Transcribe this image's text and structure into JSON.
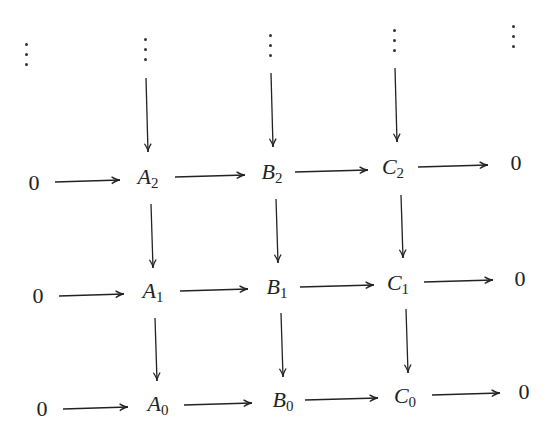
{
  "diagram": {
    "type": "commutative-diagram",
    "rows": [
      {
        "index": 2,
        "nodes": [
          {
            "id": "z2l",
            "label": "0",
            "sub": "",
            "x": 34,
            "y": 183
          },
          {
            "id": "A2",
            "label": "A",
            "sub": "2",
            "x": 148,
            "y": 178
          },
          {
            "id": "B2",
            "label": "B",
            "sub": "2",
            "x": 272,
            "y": 173
          },
          {
            "id": "C2",
            "label": "C",
            "sub": "2",
            "x": 393,
            "y": 168
          },
          {
            "id": "z2r",
            "label": "0",
            "sub": "",
            "x": 516,
            "y": 163
          }
        ]
      },
      {
        "index": 1,
        "nodes": [
          {
            "id": "z1l",
            "label": "0",
            "sub": "",
            "x": 38,
            "y": 296
          },
          {
            "id": "A1",
            "label": "A",
            "sub": "1",
            "x": 153,
            "y": 292
          },
          {
            "id": "B1",
            "label": "B",
            "sub": "1",
            "x": 277,
            "y": 288
          },
          {
            "id": "C1",
            "label": "C",
            "sub": "1",
            "x": 398,
            "y": 284
          },
          {
            "id": "z1r",
            "label": "0",
            "sub": "",
            "x": 520,
            "y": 279
          }
        ]
      },
      {
        "index": 0,
        "nodes": [
          {
            "id": "z0l",
            "label": "0",
            "sub": "",
            "x": 42,
            "y": 409
          },
          {
            "id": "A0",
            "label": "A",
            "sub": "0",
            "x": 158,
            "y": 405
          },
          {
            "id": "B0",
            "label": "B",
            "sub": "0",
            "x": 283,
            "y": 401
          },
          {
            "id": "C0",
            "label": "C",
            "sub": "0",
            "x": 405,
            "y": 397
          },
          {
            "id": "z0r",
            "label": "0",
            "sub": "",
            "x": 524,
            "y": 392
          }
        ]
      }
    ],
    "vdots": [
      {
        "x": 27,
        "y": 55
      },
      {
        "x": 146,
        "y": 50
      },
      {
        "x": 271,
        "y": 46
      },
      {
        "x": 395,
        "y": 41
      },
      {
        "x": 514,
        "y": 37
      }
    ],
    "arrows": {
      "horizontal": [
        {
          "from": "0",
          "to": "A2",
          "x1": 55,
          "y1": 182,
          "x2": 120,
          "y2": 180
        },
        {
          "from": "A2",
          "to": "B2",
          "x1": 175,
          "y1": 177,
          "x2": 245,
          "y2": 175
        },
        {
          "from": "B2",
          "to": "C2",
          "x1": 295,
          "y1": 172,
          "x2": 368,
          "y2": 170
        },
        {
          "from": "C2",
          "to": "0",
          "x1": 418,
          "y1": 167,
          "x2": 488,
          "y2": 165
        },
        {
          "from": "0",
          "to": "A1",
          "x1": 59,
          "y1": 296,
          "x2": 124,
          "y2": 294
        },
        {
          "from": "A1",
          "to": "B1",
          "x1": 180,
          "y1": 291,
          "x2": 248,
          "y2": 289
        },
        {
          "from": "B1",
          "to": "C1",
          "x1": 300,
          "y1": 287,
          "x2": 374,
          "y2": 285
        },
        {
          "from": "C1",
          "to": "0",
          "x1": 424,
          "y1": 282,
          "x2": 493,
          "y2": 280
        },
        {
          "from": "0",
          "to": "A0",
          "x1": 63,
          "y1": 409,
          "x2": 128,
          "y2": 407
        },
        {
          "from": "A0",
          "to": "B0",
          "x1": 184,
          "y1": 405,
          "x2": 252,
          "y2": 403
        },
        {
          "from": "B0",
          "to": "C0",
          "x1": 305,
          "y1": 400,
          "x2": 378,
          "y2": 398
        },
        {
          "from": "C0",
          "to": "0",
          "x1": 432,
          "y1": 395,
          "x2": 500,
          "y2": 393
        }
      ],
      "vertical": [
        {
          "from": "dots",
          "to": "A2",
          "x1": 146,
          "y1": 78,
          "x2": 148,
          "y2": 152
        },
        {
          "from": "dots",
          "to": "B2",
          "x1": 271,
          "y1": 73,
          "x2": 273,
          "y2": 147
        },
        {
          "from": "dots",
          "to": "C2",
          "x1": 395,
          "y1": 68,
          "x2": 397,
          "y2": 142
        },
        {
          "from": "A2",
          "to": "A1",
          "x1": 151,
          "y1": 204,
          "x2": 153,
          "y2": 268
        },
        {
          "from": "B2",
          "to": "B1",
          "x1": 276,
          "y1": 199,
          "x2": 278,
          "y2": 263
        },
        {
          "from": "C2",
          "to": "C1",
          "x1": 401,
          "y1": 195,
          "x2": 403,
          "y2": 258
        },
        {
          "from": "A1",
          "to": "A0",
          "x1": 155,
          "y1": 318,
          "x2": 157,
          "y2": 381
        },
        {
          "from": "B1",
          "to": "B0",
          "x1": 281,
          "y1": 313,
          "x2": 283,
          "y2": 377
        },
        {
          "from": "C1",
          "to": "C0",
          "x1": 406,
          "y1": 309,
          "x2": 408,
          "y2": 373
        }
      ]
    },
    "colors": {
      "ink": "#222222",
      "background": "#ffffff"
    }
  }
}
